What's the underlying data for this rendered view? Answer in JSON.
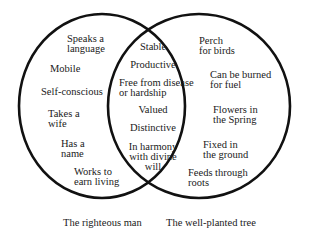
{
  "diagram": {
    "type": "venn",
    "sets": [
      {
        "name": "The righteous man",
        "unique_items": [
          "Speaks a\nlanguage",
          "Mobile",
          "Self-conscious",
          "Takes a\nwife",
          "Has a\nname",
          "Works to\nearn living"
        ]
      },
      {
        "name": "The well-planted tree",
        "unique_items": [
          "Perch\nfor birds",
          "Can be burned\nfor fuel",
          "Flowers in\nthe Spring",
          "Fixed in\nthe ground",
          "Feeds through\nroots"
        ]
      }
    ],
    "shared_items": [
      "Stable",
      "Productive",
      "Free from disease\nor hardship",
      "Valued",
      "Distinctive",
      "In harmony\nwith divine\nwill"
    ],
    "colors": {
      "outline": "#111111",
      "background": "#ffffff",
      "text": "#1a1a1a"
    }
  }
}
